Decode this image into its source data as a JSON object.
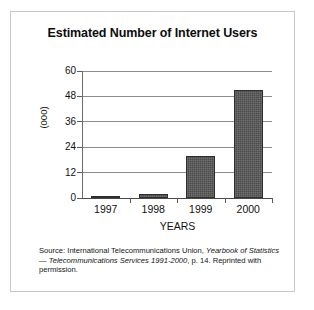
{
  "figure": {
    "title": "Estimated Number of Internet Users",
    "source_note": {
      "prefix": "Source: International Telecommunications Union, ",
      "italic_1": "Yearbook of Statistics",
      "middle": " — ",
      "italic_2": "Telecommunications Services 1991-2000",
      "suffix": ", p. 14. Reprinted with permission."
    }
  },
  "chart_data": {
    "type": "bar",
    "title": "Estimated Number of Internet Users",
    "xlabel": "YEARS",
    "ylabel": "(000)",
    "categories": [
      "1997",
      "1998",
      "1999",
      "2000"
    ],
    "values": [
      1,
      2,
      20,
      51
    ],
    "ylim": [
      0,
      60
    ],
    "yticks": [
      0,
      12,
      24,
      36,
      48,
      60
    ],
    "ytick_labels": [
      "0",
      "12",
      "24",
      "36",
      "48",
      "60"
    ],
    "grid": true,
    "legend": false,
    "bar_color": "#4b4b4b",
    "bar_edge_color": "#2e2e2e",
    "grid_color": "#8c8c8c",
    "axis_color": "#4a4a4a",
    "frame_color": "#c9c9c9",
    "background": "#ffffff"
  }
}
